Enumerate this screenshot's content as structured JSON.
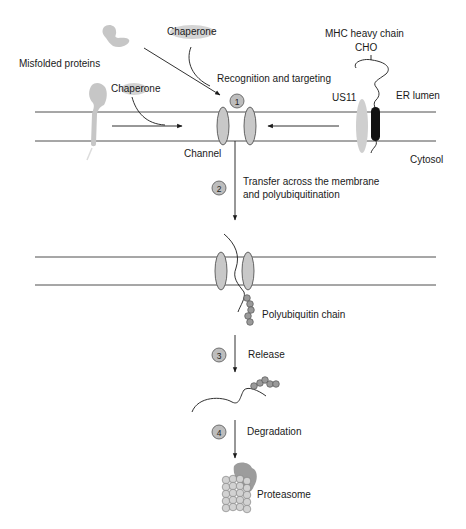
{
  "labels": {
    "misfolded_proteins": "Misfolded proteins",
    "chaperone_top": "Chaperone",
    "chaperone_left": "Chaperone",
    "recognition": "Recognition and targeting",
    "mhc": "MHC heavy chain",
    "cho": "CHO",
    "us11": "US11",
    "er_lumen": "ER lumen",
    "cytosol": "Cytosol",
    "channel": "Channel",
    "transfer_line1": "Transfer across the membrane",
    "transfer_line2": "and polyubiquitination",
    "polyubiquitin": "Polyubiquitin chain",
    "release": "Release",
    "degradation": "Degradation",
    "proteasome": "Proteasome"
  },
  "steps": [
    {
      "number": "1",
      "label": "Recognition and targeting"
    },
    {
      "number": "2",
      "label": "Transfer across the membrane and polyubiquitination"
    },
    {
      "number": "3",
      "label": "Release"
    },
    {
      "number": "4",
      "label": "Degradation"
    }
  ],
  "colors": {
    "membrane": "#3a3a3a",
    "channel_fill": "#c8c8c8",
    "protein_blob": "#c6c6c6",
    "mhc_tm": "#111111",
    "ubiquitin": "#9a9a9a"
  }
}
